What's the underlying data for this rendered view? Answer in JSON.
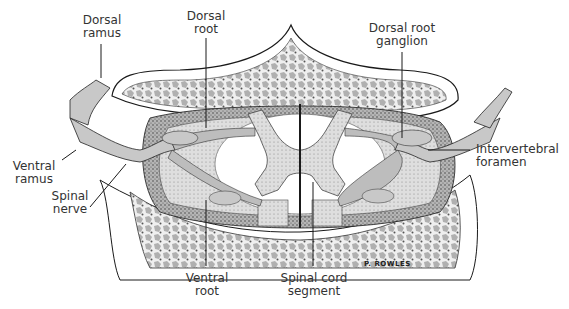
{
  "diagram": {
    "signature": "P. ROWLES",
    "labels": [
      {
        "id": "dorsal-ramus",
        "line1": "Dorsal",
        "line2": "ramus"
      },
      {
        "id": "dorsal-root",
        "line1": "Dorsal",
        "line2": "root"
      },
      {
        "id": "dorsal-root-ganglion",
        "line1": "Dorsal root",
        "line2": "ganglion"
      },
      {
        "id": "ventral-ramus",
        "line1": "Ventral",
        "line2": "ramus"
      },
      {
        "id": "intervertebral-foramen",
        "line1": "Intervertebral",
        "line2": "foramen"
      },
      {
        "id": "spinal-nerve",
        "line1": "Spinal",
        "line2": "nerve"
      },
      {
        "id": "ventral-root",
        "line1": "Ventral",
        "line2": "root"
      },
      {
        "id": "spinal-cord-segment",
        "line1": "Spinal cord",
        "line2": "segment"
      }
    ]
  },
  "colors": {
    "ink": "#1a1a1a",
    "nerve": "#c8c8c8",
    "bone": "#d9d9d9",
    "cord": "#ffffff",
    "dura": "#8a8a8a",
    "label": "#333333"
  }
}
